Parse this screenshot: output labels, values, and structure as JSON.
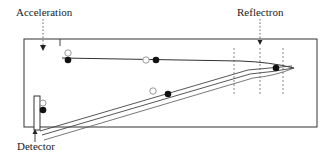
{
  "diagram": {
    "labels": {
      "acceleration": "Acceleration",
      "reflectron": "Reflectron",
      "detector": "Detector"
    },
    "colors": {
      "line": "#333333",
      "dashed": "#888888",
      "filled_ion": "#111111",
      "open_ion": "#999999",
      "background": "#ffffff"
    },
    "components": [
      {
        "name": "flight-tube",
        "shape": "rectangle"
      },
      {
        "name": "acceleration-region",
        "marker": "dotted arrow down"
      },
      {
        "name": "reflectron",
        "marker": "dotted arrow down",
        "grids": 3
      },
      {
        "name": "detector",
        "marker": "arrow up"
      }
    ],
    "ions": [
      {
        "type": "open",
        "position": "start"
      },
      {
        "type": "filled",
        "position": "start"
      },
      {
        "type": "open",
        "position": "mid-outgoing"
      },
      {
        "type": "filled",
        "position": "mid-outgoing"
      },
      {
        "type": "filled",
        "position": "reflectron-turnaround"
      },
      {
        "type": "open",
        "position": "mid-return"
      },
      {
        "type": "filled",
        "position": "mid-return"
      },
      {
        "type": "open",
        "position": "detector"
      },
      {
        "type": "filled",
        "position": "detector"
      }
    ]
  }
}
